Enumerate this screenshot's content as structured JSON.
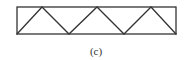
{
  "figure": {
    "caption": "(c)",
    "stroke_color": "#333333",
    "truss": {
      "type": "warren-truss",
      "frame": {
        "x1": 17,
        "y1": 7,
        "x2": 176,
        "y2": 34
      },
      "top_nodes_x": [
        42,
        97,
        151
      ],
      "bottom_nodes_x": [
        17,
        69,
        124,
        176
      ],
      "panels": 6
    }
  }
}
